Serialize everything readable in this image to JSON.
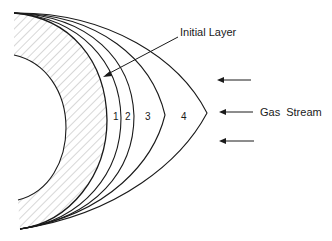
{
  "diagram": {
    "labels": {
      "initial_layer": "Initial Layer",
      "gas_stream": "Gas Stream"
    },
    "layers": [
      {
        "id": "1",
        "label": "1"
      },
      {
        "id": "2",
        "label": "2"
      },
      {
        "id": "3",
        "label": "3"
      },
      {
        "id": "4",
        "label": "4"
      }
    ],
    "arrows": {
      "count": 3,
      "direction": "left"
    },
    "colors": {
      "stroke": "#1a1a1a",
      "hatch": "#9a9a9a",
      "background": "#ffffff"
    }
  }
}
